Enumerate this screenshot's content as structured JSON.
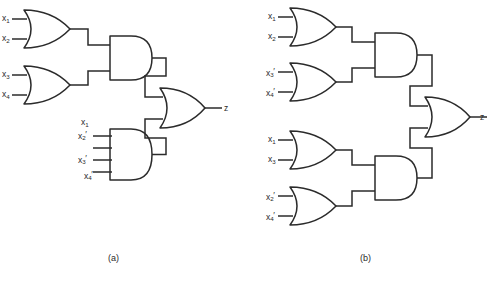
{
  "figure": {
    "background_color": "#ffffff",
    "line_color": "#2b2b2b",
    "width": 492,
    "height": 283
  },
  "panels": [
    {
      "id": "panel-a",
      "caption": "(a)",
      "output_label": "z",
      "gates": [
        {
          "id": "a-or-1",
          "type": "OR",
          "inputs": [
            "x1",
            "x2"
          ],
          "input_labels": [
            {
              "base": "x",
              "sub": "1",
              "prime": false,
              "text": "x1"
            },
            {
              "base": "x",
              "sub": "2",
              "prime": false,
              "text": "x2"
            }
          ]
        },
        {
          "id": "a-or-2",
          "type": "OR",
          "inputs": [
            "x3",
            "x4"
          ],
          "input_labels": [
            {
              "base": "x",
              "sub": "3",
              "prime": false,
              "text": "x3"
            },
            {
              "base": "x",
              "sub": "4",
              "prime": false,
              "text": "x4"
            }
          ]
        },
        {
          "id": "a-and-1",
          "type": "AND",
          "inputs": [
            "a-or-1",
            "a-or-2"
          ],
          "input_labels": []
        },
        {
          "id": "a-and-2",
          "type": "AND",
          "inputs": [
            "x1",
            "x2'",
            "x3'",
            "x4'"
          ],
          "input_labels": [
            {
              "base": "x",
              "sub": "1",
              "prime": false,
              "text": "x1"
            },
            {
              "base": "x",
              "sub": "2",
              "prime": true,
              "text": "x2'"
            },
            {
              "base": "x",
              "sub": "3",
              "prime": true,
              "text": "x3'"
            },
            {
              "base": "x",
              "sub": "4",
              "prime": true,
              "text": "x4'"
            }
          ]
        },
        {
          "id": "a-or-out",
          "type": "OR",
          "inputs": [
            "a-and-1",
            "a-and-2"
          ],
          "input_labels": []
        }
      ]
    },
    {
      "id": "panel-b",
      "caption": "(b)",
      "output_label": "z",
      "gates": [
        {
          "id": "b-or-1",
          "type": "OR",
          "inputs": [
            "x1",
            "x2"
          ],
          "input_labels": [
            {
              "base": "x",
              "sub": "1",
              "prime": false,
              "text": "x1"
            },
            {
              "base": "x",
              "sub": "2",
              "prime": false,
              "text": "x2"
            }
          ]
        },
        {
          "id": "b-or-2",
          "type": "OR",
          "inputs": [
            "x3'",
            "x4'"
          ],
          "input_labels": [
            {
              "base": "x",
              "sub": "3",
              "prime": true,
              "text": "x3'"
            },
            {
              "base": "x",
              "sub": "4",
              "prime": true,
              "text": "x4'"
            }
          ]
        },
        {
          "id": "b-and-1",
          "type": "AND",
          "inputs": [
            "b-or-1",
            "b-or-2"
          ],
          "input_labels": []
        },
        {
          "id": "b-or-3",
          "type": "OR",
          "inputs": [
            "x1",
            "x3"
          ],
          "input_labels": [
            {
              "base": "x",
              "sub": "1",
              "prime": false,
              "text": "x1"
            },
            {
              "base": "x",
              "sub": "3",
              "prime": false,
              "text": "x3"
            }
          ]
        },
        {
          "id": "b-or-4",
          "type": "OR",
          "inputs": [
            "x2'",
            "x4'"
          ],
          "input_labels": [
            {
              "base": "x",
              "sub": "2",
              "prime": true,
              "text": "x2'"
            },
            {
              "base": "x",
              "sub": "4",
              "prime": true,
              "text": "x4'"
            }
          ]
        },
        {
          "id": "b-and-2",
          "type": "AND",
          "inputs": [
            "b-or-3",
            "b-or-4"
          ],
          "input_labels": []
        },
        {
          "id": "b-or-out",
          "type": "OR",
          "inputs": [
            "b-and-1",
            "b-and-2"
          ],
          "input_labels": []
        }
      ]
    }
  ],
  "labels": {
    "a": {
      "or1_in1": "x",
      "or1_in1_sub": "1",
      "or1_in2": "x",
      "or1_in2_sub": "2",
      "or2_in1": "x",
      "or2_in1_sub": "3",
      "or2_in2": "x",
      "or2_in2_sub": "4",
      "and2_in1": "x",
      "and2_in1_sub": "1",
      "and2_in1_prime": "",
      "and2_in2": "x",
      "and2_in2_sub": "2",
      "and2_in2_prime": "'",
      "and2_in3": "x",
      "and2_in3_sub": "3",
      "and2_in3_prime": "'",
      "and2_in4": "x",
      "and2_in4_sub": "4",
      "and2_in4_prime": "'",
      "output": "z",
      "caption": "(a)"
    },
    "b": {
      "or1_in1": "x",
      "or1_in1_sub": "1",
      "or1_in2": "x",
      "or1_in2_sub": "2",
      "or2_in1": "x",
      "or2_in1_sub": "3",
      "or2_in1_prime": "'",
      "or2_in2": "x",
      "or2_in2_sub": "4",
      "or2_in2_prime": "'",
      "or3_in1": "x",
      "or3_in1_sub": "1",
      "or3_in2": "x",
      "or3_in2_sub": "3",
      "or4_in1": "x",
      "or4_in1_sub": "2",
      "or4_in1_prime": "'",
      "or4_in2": "x",
      "or4_in2_sub": "4",
      "or4_in2_prime": "'",
      "output": "z",
      "caption": "(b)"
    }
  }
}
